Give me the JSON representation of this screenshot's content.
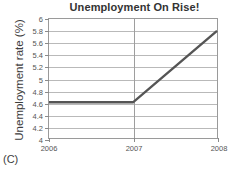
{
  "chart_data": {
    "type": "line",
    "title": "Unemployment On Rise!",
    "xlabel": "",
    "ylabel": "Unemployment rate (%)",
    "x": [
      2006,
      2007,
      2008
    ],
    "series": [
      {
        "name": "Unemployment rate",
        "values": [
          4.6,
          4.6,
          5.8
        ]
      }
    ],
    "xlim": [
      2006,
      2008
    ],
    "ylim": [
      4,
      6
    ],
    "xticks": [
      "2006",
      "2007",
      "2008"
    ],
    "yticks": [
      "4",
      "4.2",
      "4.4",
      "4.6",
      "4.8",
      "5",
      "5.2",
      "5.4",
      "5.6",
      "5.8",
      "6"
    ],
    "ytick_values": [
      4,
      4.2,
      4.4,
      4.6,
      4.8,
      5,
      5.2,
      5.4,
      5.6,
      5.8,
      6
    ],
    "grid": "horizontal-and-vertical",
    "legend": "none",
    "line_color": "#555555",
    "grid_color": "#b9b9b9",
    "axis_color": "#9a9a9a"
  },
  "figure": {
    "panel_letter": "(C)"
  }
}
